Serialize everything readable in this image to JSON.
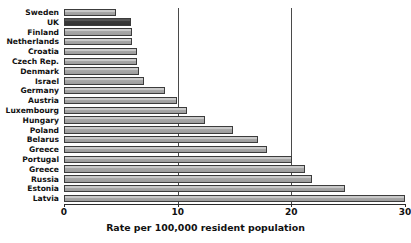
{
  "chart_data": {
    "type": "bar",
    "orientation": "horizontal",
    "title": "",
    "xlabel": "Rate per 100,000 resident population",
    "ylabel": "",
    "xlim": [
      0,
      30
    ],
    "xticks": [
      0,
      10,
      20,
      30
    ],
    "xtick_labels": [
      "0",
      "10",
      "20",
      "30"
    ],
    "grid": true,
    "gridlines_at": [
      10,
      20
    ],
    "legend": null,
    "highlight_category": "UK",
    "colors": {
      "bar_fill": "#c9c9c9",
      "bar_edge": "#3c3c3c",
      "highlight_fill": "#4a4a4a",
      "axis": "#2b2b2b",
      "text": "#111111"
    },
    "categories": [
      "Sweden",
      "UK",
      "Finland",
      "Netherlands",
      "Croatia",
      "Czech Rep.",
      "Denmark",
      "Israel",
      "Germany",
      "Austria",
      "Luxembourg",
      "Hungary",
      "Poland",
      "Belarus",
      "Greece",
      "Portugal",
      "Greece",
      "Russia",
      "Estonia",
      "Latvia"
    ],
    "values": [
      4.6,
      5.9,
      6.0,
      6.0,
      6.4,
      6.4,
      6.6,
      7.0,
      8.9,
      9.9,
      10.8,
      12.4,
      14.9,
      17.1,
      17.9,
      20.1,
      21.2,
      21.8,
      24.7,
      30.0
    ]
  }
}
